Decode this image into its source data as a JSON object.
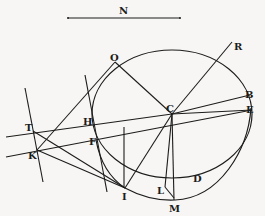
{
  "figure": {
    "colors": {
      "ink": "#1c1c1c",
      "paper": "#f7f6f4"
    },
    "scale_bar": {
      "label": "N"
    },
    "points": {
      "N": "N",
      "O": "O",
      "R": "R",
      "B": "B",
      "E": "E",
      "C": "C",
      "H": "H",
      "T": "T",
      "F": "F",
      "K": "K",
      "I": "I",
      "L": "L",
      "D": "D",
      "M": "M"
    }
  }
}
